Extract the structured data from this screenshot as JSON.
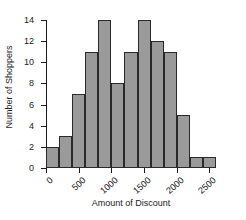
{
  "chart_data": {
    "type": "bar",
    "title": "",
    "xlabel": "Amount of Discount",
    "ylabel": "Number of Shoppers",
    "bin_width": 200,
    "bin_starts": [
      0,
      200,
      400,
      600,
      800,
      1000,
      1200,
      1400,
      1600,
      1800,
      2000,
      2200,
      2400
    ],
    "bin_ends": [
      200,
      400,
      600,
      800,
      1000,
      1200,
      1400,
      1600,
      1800,
      2000,
      2200,
      2400,
      2600
    ],
    "categories": [
      "0-200",
      "200-400",
      "400-600",
      "600-800",
      "800-1000",
      "1000-1200",
      "1200-1400",
      "1400-1600",
      "1600-1800",
      "1800-2000",
      "2000-2200",
      "2200-2400",
      "2400-2600"
    ],
    "values": [
      2,
      3,
      7,
      11,
      14,
      8,
      11,
      14,
      12,
      11,
      5,
      1,
      1
    ],
    "xlim": [
      0,
      2600
    ],
    "ylim": [
      0,
      14
    ],
    "xticks": [
      0,
      500,
      1000,
      1500,
      2000,
      2500
    ],
    "xtick_labels": [
      "0",
      "500",
      "1000",
      "1500",
      "2000",
      "2500"
    ],
    "yticks": [
      0,
      2,
      4,
      6,
      8,
      10,
      12,
      14
    ],
    "ytick_labels": [
      "0",
      "2",
      "4",
      "6",
      "8",
      "10",
      "12",
      "14"
    ],
    "grid": false,
    "legend": null,
    "bar_color": "#9a9a9a",
    "bar_edge_color": "#2a2a2a",
    "axis_color": "#1b1b1b",
    "background_color": "#ffffff"
  }
}
